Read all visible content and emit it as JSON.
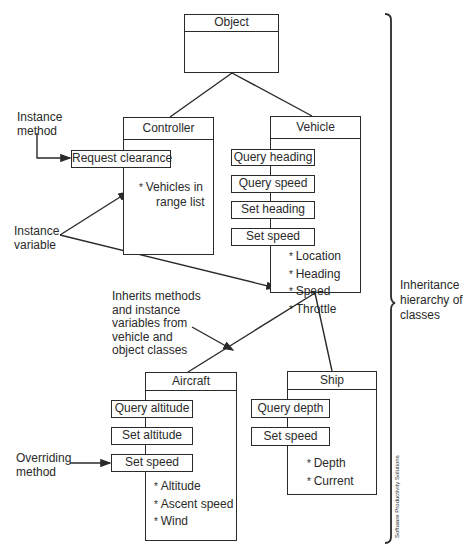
{
  "classes": {
    "object": {
      "name": "Object"
    },
    "controller": {
      "name": "Controller",
      "methods": [
        "Request clearance"
      ],
      "variables": [
        "Vehicles in",
        "range list"
      ]
    },
    "vehicle": {
      "name": "Vehicle",
      "methods": [
        "Query heading",
        "Query speed",
        "Set heading",
        "Set speed"
      ],
      "variables": [
        "Location",
        "Heading",
        "Speed",
        "Throttle"
      ]
    },
    "aircraft": {
      "name": "Aircraft",
      "methods": [
        "Query altitude",
        "Set altitude",
        "Set speed"
      ],
      "variables": [
        "Altitude",
        "Ascent speed",
        "Wind"
      ]
    },
    "ship": {
      "name": "Ship",
      "methods": [
        "Query depth",
        "Set speed"
      ],
      "variables": [
        "Depth",
        "Current"
      ]
    }
  },
  "annotations": {
    "instance_method": [
      "Instance",
      "method"
    ],
    "instance_variable": [
      "Instance",
      "variable"
    ],
    "inherits": [
      "Inherits methods",
      "and instance",
      "variables from",
      "vehicle and",
      "object classes"
    ],
    "overriding_method": [
      "Overriding",
      "method"
    ],
    "hierarchy": [
      "Inheritance",
      "hierarchy of",
      "classes"
    ]
  },
  "credit": "Software Productivity Solutions"
}
